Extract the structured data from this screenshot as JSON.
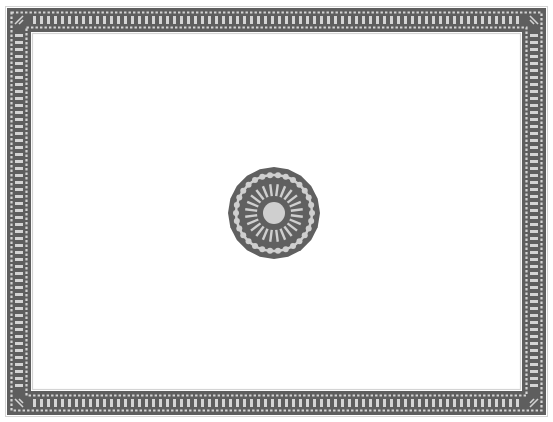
{
  "image": {
    "width": 553,
    "height": 422,
    "description": "Decorative rectangular border frame with a central circular medallion ornament"
  },
  "colors": {
    "background": "#ffffff",
    "frame_dark": "#5e5e5e",
    "frame_light": "#d4d4d4",
    "medallion_dark": "#606060",
    "medallion_light": "#cfcfcf"
  },
  "frame": {
    "outer": {
      "x": 7,
      "y": 8,
      "width": 539,
      "height": 407
    },
    "band_width": 24,
    "bar_spacing": 7,
    "dot_spacing": 4.5
  },
  "medallion": {
    "cx": 274,
    "cy": 213,
    "outer_radius": 46,
    "scallop_radius": 38,
    "inner_radius": 34,
    "center_radius": 11,
    "ray_count": 24
  }
}
